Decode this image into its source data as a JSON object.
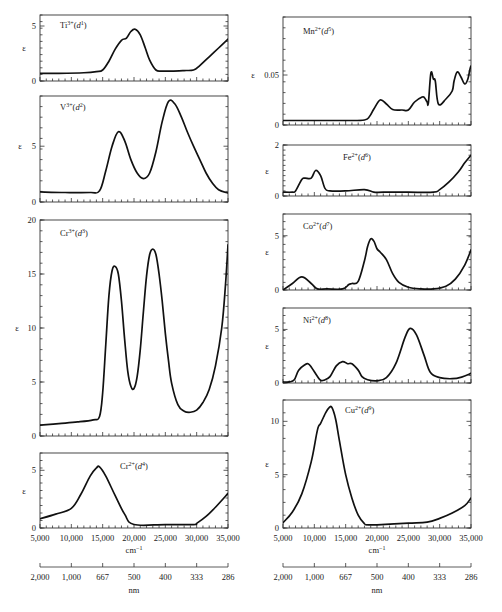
{
  "chart_data": {
    "type": "line",
    "shared_x": {
      "xlabel": "cm⁻¹",
      "xlim": [
        5000,
        35000
      ],
      "x_ticks": [
        5000,
        10000,
        15000,
        20000,
        25000,
        30000,
        35000
      ],
      "x_tick_labels": [
        "5,000",
        "10,000",
        "15,000",
        "20,000",
        "25,000",
        "30,000",
        "35,000"
      ],
      "secondary_axis_label": "nm",
      "secondary_ticks_cm": [
        5000,
        10000,
        15000,
        20000,
        25000,
        30000,
        35000
      ],
      "secondary_tick_labels": [
        "2,000",
        "1,000",
        "667",
        "500",
        "400",
        "333",
        "286"
      ]
    },
    "ylabel": "ε",
    "panels": [
      {
        "id": "ti",
        "column": "left",
        "ion": "Ti",
        "charge": "3+",
        "config": "d",
        "electrons": "1",
        "ylim": [
          0,
          6
        ],
        "y_ticks": [
          0,
          5
        ],
        "y_tick_labels": [
          "0",
          "5"
        ],
        "box": [
          40,
          15,
          228,
          81
        ],
        "x": [
          5000,
          8000,
          12000,
          14000,
          15000,
          16000,
          17000,
          18000,
          18800,
          19500,
          20200,
          21000,
          21800,
          22500,
          23500,
          24500,
          26000,
          28000,
          29500,
          30500,
          32000,
          33500,
          35000
        ],
        "y": [
          0.7,
          0.7,
          0.75,
          0.85,
          1.0,
          1.8,
          2.9,
          3.7,
          3.9,
          4.5,
          4.7,
          4.2,
          3.0,
          1.9,
          1.0,
          0.9,
          0.9,
          0.95,
          1.0,
          1.4,
          2.2,
          3.0,
          3.8
        ]
      },
      {
        "id": "v",
        "column": "left",
        "ion": "V",
        "charge": "3+",
        "config": "d",
        "electrons": "2",
        "ylim": [
          0,
          9.5
        ],
        "y_ticks": [
          0,
          5
        ],
        "y_tick_labels": [
          "0",
          "5"
        ],
        "box": [
          40,
          96,
          228,
          202
        ],
        "x": [
          5000,
          9000,
          13000,
          14500,
          15500,
          16500,
          17500,
          18500,
          19500,
          20500,
          21500,
          22500,
          23500,
          24500,
          25500,
          26500,
          27500,
          28500,
          29500,
          30500,
          31500,
          32500,
          33500,
          35000
        ],
        "y": [
          0.9,
          0.85,
          0.85,
          1.0,
          2.8,
          5.0,
          6.3,
          5.5,
          3.8,
          2.6,
          2.1,
          2.6,
          4.5,
          7.2,
          9.0,
          8.8,
          7.7,
          6.3,
          5.0,
          3.8,
          2.6,
          1.7,
          1.1,
          0.8
        ]
      },
      {
        "id": "cr3",
        "column": "left",
        "ion": "Cr",
        "charge": "3+",
        "config": "d",
        "electrons": "3",
        "ylim": [
          0,
          20
        ],
        "y_ticks": [
          0,
          5,
          10,
          15,
          20
        ],
        "y_tick_labels": [
          "0",
          "5",
          "10",
          "15",
          "20"
        ],
        "box": [
          40,
          220,
          228,
          436
        ],
        "x": [
          5000,
          8000,
          11000,
          13500,
          14500,
          15000,
          15500,
          16000,
          16500,
          17000,
          17500,
          18000,
          18500,
          19000,
          19500,
          20000,
          20500,
          21000,
          21500,
          22000,
          22500,
          23000,
          23500,
          24000,
          24500,
          25000,
          25500,
          26000,
          27000,
          28000,
          29000,
          30000,
          31000,
          32000,
          33000,
          34000,
          34600,
          35000
        ],
        "y": [
          1.0,
          1.15,
          1.3,
          1.5,
          1.8,
          4.0,
          8.5,
          13.0,
          15.3,
          15.7,
          15.0,
          12.5,
          9.0,
          6.0,
          4.6,
          4.4,
          5.5,
          8.0,
          11.5,
          14.8,
          16.8,
          17.3,
          16.8,
          15.0,
          12.5,
          9.5,
          7.0,
          4.9,
          2.9,
          2.3,
          2.2,
          2.4,
          3.1,
          4.3,
          6.5,
          10.0,
          14.0,
          17.7
        ]
      },
      {
        "id": "cr2",
        "column": "left",
        "ion": "Cr",
        "charge": "2+",
        "config": "d",
        "electrons": "4",
        "ylim": [
          0,
          6.5
        ],
        "y_ticks": [
          0,
          5
        ],
        "y_tick_labels": [
          "0",
          "5"
        ],
        "box": [
          40,
          453,
          228,
          528
        ],
        "x": [
          5000,
          7500,
          10000,
          11500,
          13000,
          14000,
          14500,
          15500,
          17000,
          18500,
          20000,
          25000,
          29500,
          30000,
          31500,
          33000,
          35000
        ],
        "y": [
          0.8,
          1.2,
          1.7,
          2.9,
          4.5,
          5.2,
          5.3,
          4.5,
          2.8,
          1.2,
          0.3,
          0.3,
          0.3,
          0.4,
          1.0,
          1.8,
          3.0
        ]
      },
      {
        "id": "mn",
        "column": "right",
        "ion": "Mn",
        "charge": "2+",
        "config": "d",
        "electrons": "5",
        "ylim": [
          0,
          0.108
        ],
        "y_ticks": [
          0,
          0.05
        ],
        "y_tick_labels": [
          "0",
          "0.05"
        ],
        "box": [
          283,
          17,
          471,
          125
        ],
        "x": [
          5000,
          10000,
          15000,
          18000,
          18800,
          19500,
          20500,
          21500,
          22500,
          24000,
          25000,
          26000,
          27200,
          27600,
          28000,
          28200,
          28600,
          29000,
          29300,
          29800,
          31000,
          32000,
          32300,
          32800,
          33400,
          34000,
          34500,
          35000,
          35500,
          36000,
          37000,
          38000
        ],
        "y": [
          0.0045,
          0.0045,
          0.0045,
          0.005,
          0.0085,
          0.016,
          0.025,
          0.021,
          0.0155,
          0.015,
          0.015,
          0.023,
          0.028,
          0.027,
          0.023,
          0.022,
          0.052,
          0.046,
          0.044,
          0.021,
          0.026,
          0.034,
          0.044,
          0.053,
          0.048,
          0.041,
          0.046,
          0.059,
          0.053,
          0.048,
          0.068,
          0.097
        ]
      },
      {
        "id": "fe",
        "column": "right",
        "ion": "Fe",
        "charge": "2+",
        "config": "d",
        "electrons": "6",
        "ylim": [
          0,
          2
        ],
        "y_ticks": [
          0,
          2
        ],
        "y_tick_labels": [
          "0",
          "2"
        ],
        "box": [
          283,
          145,
          471,
          196
        ],
        "x": [
          5000,
          6500,
          7000,
          8000,
          8500,
          9500,
          10200,
          11000,
          11700,
          12500,
          15000,
          18000,
          19500,
          21000,
          25000,
          29000,
          30000,
          31500,
          33000,
          34000,
          35000
        ],
        "y": [
          0.15,
          0.15,
          0.2,
          0.65,
          0.7,
          0.7,
          1.0,
          0.8,
          0.3,
          0.2,
          0.2,
          0.25,
          0.15,
          0.15,
          0.15,
          0.15,
          0.25,
          0.55,
          0.95,
          1.3,
          1.6
        ]
      },
      {
        "id": "co",
        "column": "right",
        "ion": "Co",
        "charge": "2+",
        "config": "d",
        "electrons": "7",
        "ylim": [
          0,
          7
        ],
        "y_ticks": [
          0,
          5
        ],
        "y_tick_labels": [
          "0",
          "5"
        ],
        "box": [
          283,
          214,
          471,
          290
        ],
        "x": [
          5000,
          6500,
          8000,
          9500,
          10500,
          12000,
          14500,
          15500,
          16000,
          17000,
          18000,
          18500,
          19000,
          19500,
          20000,
          20500,
          21500,
          22500,
          23500,
          25000,
          27000,
          29000,
          31000,
          32500,
          34000,
          35000
        ],
        "y": [
          0.0,
          0.6,
          1.2,
          0.6,
          0.1,
          0.1,
          0.1,
          0.5,
          0.6,
          0.8,
          2.7,
          4.0,
          4.7,
          4.5,
          3.8,
          3.5,
          2.8,
          1.5,
          0.7,
          0.25,
          0.1,
          0.1,
          0.35,
          1.0,
          2.3,
          3.7
        ]
      },
      {
        "id": "ni",
        "column": "right",
        "ion": "Ni",
        "charge": "2+",
        "config": "d",
        "electrons": "8",
        "ylim": [
          0,
          7
        ],
        "y_ticks": [
          0,
          5
        ],
        "y_tick_labels": [
          "0",
          "5"
        ],
        "box": [
          283,
          308,
          471,
          383
        ],
        "x": [
          5000,
          6000,
          6800,
          7500,
          8500,
          9000,
          9500,
          10500,
          11000,
          11500,
          12500,
          13500,
          14500,
          15300,
          16000,
          17000,
          17600,
          18500,
          20000,
          21500,
          23000,
          24500,
          25300,
          26300,
          27500,
          28500,
          30000,
          32000,
          33500,
          35000
        ],
        "y": [
          0.1,
          0.1,
          0.3,
          1.2,
          1.7,
          1.8,
          1.5,
          0.6,
          0.25,
          0.25,
          0.6,
          1.6,
          2.0,
          1.8,
          1.8,
          1.2,
          0.6,
          0.3,
          0.2,
          0.5,
          1.8,
          4.3,
          5.1,
          4.5,
          2.6,
          1.0,
          0.5,
          0.4,
          0.55,
          0.9
        ]
      },
      {
        "id": "cu",
        "column": "right",
        "ion": "Cu",
        "charge": "2+",
        "config": "d",
        "electrons": "9",
        "ylim": [
          0,
          12
        ],
        "y_ticks": [
          0,
          5,
          10
        ],
        "y_tick_labels": [
          "0",
          "5",
          "10"
        ],
        "box": [
          283,
          400,
          471,
          528
        ],
        "x": [
          5000,
          6500,
          8000,
          9500,
          10500,
          11000,
          11800,
          12400,
          12800,
          13400,
          14000,
          15000,
          16000,
          17000,
          18000,
          18500,
          20000,
          25000,
          28000,
          30000,
          32000,
          34000,
          35000
        ],
        "y": [
          0.5,
          1.5,
          3.2,
          6.2,
          9.2,
          9.8,
          10.8,
          11.3,
          11.3,
          10.2,
          8.2,
          5.0,
          2.8,
          1.2,
          0.4,
          0.3,
          0.3,
          0.45,
          0.55,
          0.9,
          1.4,
          2.1,
          2.8
        ]
      }
    ]
  }
}
